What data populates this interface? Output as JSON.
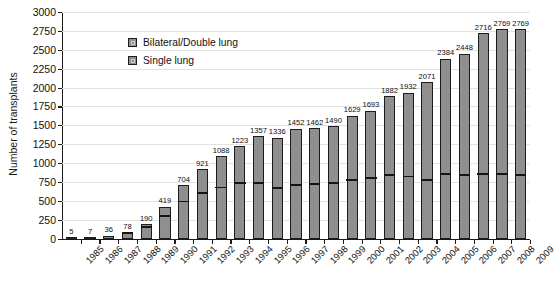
{
  "chart_data": {
    "type": "bar",
    "stacked": true,
    "title": "",
    "xlabel": "",
    "ylabel": "Number of transplants",
    "ylim": [
      0,
      3000
    ],
    "ytick_step": 250,
    "yticks": [
      0,
      250,
      500,
      750,
      1000,
      1250,
      1500,
      1750,
      2000,
      2250,
      2500,
      2750,
      3000
    ],
    "grid": true,
    "legend_position": "upper-left-inside",
    "categories": [
      "1985",
      "1986",
      "1987",
      "1988",
      "1989",
      "1990",
      "1991",
      "1992",
      "1993",
      "1994",
      "1995",
      "1996",
      "1997",
      "1998",
      "1999",
      "2000",
      "2001",
      "2002",
      "2003",
      "2004",
      "2005",
      "2006",
      "2007",
      "2008",
      "2009"
    ],
    "totals": [
      5,
      7,
      36,
      78,
      190,
      419,
      704,
      921,
      1088,
      1223,
      1357,
      1336,
      1452,
      1462,
      1490,
      1629,
      1693,
      1882,
      1932,
      2071,
      2384,
      2448,
      2716,
      2769,
      2769
    ],
    "series": [
      {
        "name": "Single lung",
        "values": [
          5,
          7,
          30,
          62,
          140,
          290,
          478,
          592,
          664,
          722,
          724,
          652,
          700,
          712,
          718,
          768,
          790,
          834,
          808,
          760,
          840,
          830,
          846,
          840,
          834
        ]
      },
      {
        "name": "Bilateral/Double lung",
        "values": [
          0,
          0,
          6,
          16,
          50,
          129,
          226,
          329,
          424,
          501,
          633,
          684,
          752,
          750,
          772,
          861,
          903,
          1048,
          1124,
          1311,
          1544,
          1618,
          1870,
          1929,
          1935
        ]
      }
    ],
    "bar_labels": [
      "5",
      "7",
      "36",
      "78",
      "190",
      "419",
      "704",
      "921",
      "1088",
      "1223",
      "1357",
      "1336",
      "1452",
      "1462",
      "1490",
      "1629",
      "1693",
      "1882",
      "1932",
      "2071",
      "2384",
      "2448",
      "2716",
      "2769",
      "2769"
    ],
    "colors": {
      "bar_fill": "#8f8f8f",
      "bar_border": "#1d1d1d",
      "divider": "#151515",
      "gridline": "#e2e2e2",
      "axis": "#1a1a1a",
      "text": "#111111"
    }
  },
  "legend": {
    "items": [
      {
        "label": "Bilateral/Double lung"
      },
      {
        "label": "Single lung"
      }
    ]
  },
  "axes": {
    "y_title": "Number of transplants"
  }
}
